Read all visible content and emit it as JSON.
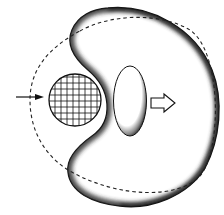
{
  "diagram": {
    "type": "cell-engulfment-illustration",
    "labels": [],
    "elements": {
      "cell_body": {
        "shape": "kidney",
        "fill": "#ffffff",
        "edge_shadow": "#1a1a1a"
      },
      "original_outline": {
        "shape": "dashed-circle",
        "stroke": "#222222"
      },
      "particle": {
        "shape": "gridded-circle",
        "stroke": "#111111"
      },
      "nucleus": {
        "shape": "ellipse",
        "fill": "#ffffff",
        "edge_shadow": "#222222"
      },
      "incoming_arrow": {
        "direction": "right",
        "style": "solid-line"
      },
      "movement_arrow": {
        "direction": "right",
        "style": "hollow-block"
      }
    },
    "colors": {
      "background": "#ffffff",
      "ink": "#111111",
      "shadow": "#2a2a2a"
    }
  }
}
